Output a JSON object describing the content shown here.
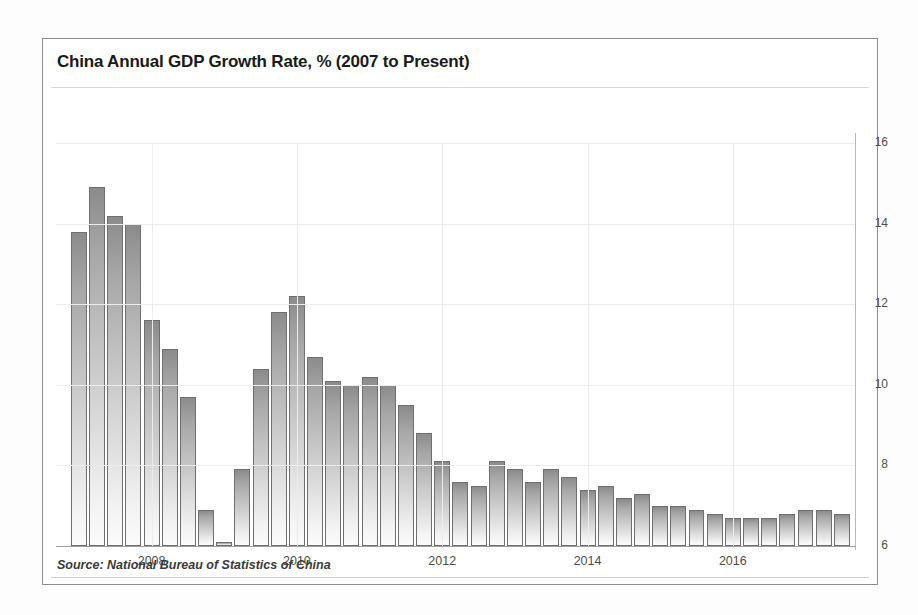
{
  "chart": {
    "title": "China Annual GDP Growth Rate, % (2007 to Present)",
    "source": "Source: National Bureau of Statistics of China"
  },
  "chart_data": {
    "type": "bar",
    "title": "China Annual GDP Growth Rate, % (2007 to Present)",
    "xlabel": "",
    "ylabel": "",
    "ylim": [
      6,
      16
    ],
    "grid": true,
    "legend": "none",
    "yticks": [
      6,
      8,
      10,
      12,
      14,
      16
    ],
    "ytick_labels": [
      "6",
      "8",
      "10",
      "12",
      "14",
      "16"
    ],
    "xtick_labels": [
      "2008",
      "2010",
      "2012",
      "2014",
      "2016"
    ],
    "xtick_categories": [
      "2008Q1",
      "2010Q1",
      "2012Q1",
      "2014Q1",
      "2016Q1"
    ],
    "categories": [
      "2007Q1",
      "2007Q2",
      "2007Q3",
      "2007Q4",
      "2008Q1",
      "2008Q2",
      "2008Q3",
      "2008Q4",
      "2009Q1",
      "2009Q2",
      "2009Q3",
      "2009Q4",
      "2010Q1",
      "2010Q2",
      "2010Q3",
      "2010Q4",
      "2011Q1",
      "2011Q2",
      "2011Q3",
      "2011Q4",
      "2012Q1",
      "2012Q2",
      "2012Q3",
      "2012Q4",
      "2013Q1",
      "2013Q2",
      "2013Q3",
      "2013Q4",
      "2014Q1",
      "2014Q2",
      "2014Q3",
      "2014Q4",
      "2015Q1",
      "2015Q2",
      "2015Q3",
      "2015Q4",
      "2016Q1",
      "2016Q2",
      "2016Q3",
      "2016Q4",
      "2017Q1",
      "2017Q2",
      "2017Q3"
    ],
    "values": [
      13.8,
      14.9,
      14.2,
      14.0,
      11.6,
      10.9,
      9.7,
      6.9,
      6.1,
      7.9,
      10.4,
      11.8,
      12.2,
      10.7,
      10.1,
      10.0,
      10.2,
      10.0,
      9.5,
      8.8,
      8.1,
      7.6,
      7.5,
      8.1,
      7.9,
      7.6,
      7.9,
      7.7,
      7.4,
      7.5,
      7.2,
      7.3,
      7.0,
      7.0,
      6.9,
      6.8,
      6.7,
      6.7,
      6.7,
      6.8,
      6.9,
      6.9,
      6.8
    ]
  }
}
